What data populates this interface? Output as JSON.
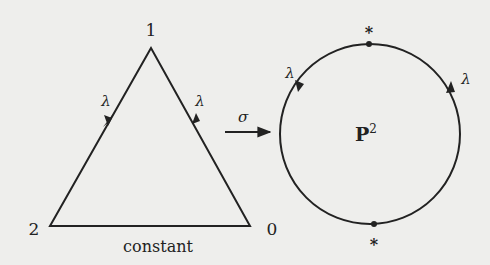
{
  "diagram": {
    "triangle": {
      "vertices": [
        {
          "label": "1",
          "x": 151,
          "y": 48
        },
        {
          "label": "2",
          "x": 50,
          "y": 226
        },
        {
          "label": "0",
          "x": 250,
          "y": 226
        }
      ],
      "left_edge_label": "λ",
      "right_edge_label": "λ",
      "bottom_edge_label": "constant"
    },
    "map": {
      "label": "σ"
    },
    "circle": {
      "center_label": "P",
      "center_label_superscript": "2",
      "top_point_label": "*",
      "bottom_point_label": "*",
      "left_arc_label": "λ",
      "right_arc_label": "λ"
    },
    "colors": {
      "background": "#eeeeec",
      "ink": "#222222"
    }
  }
}
